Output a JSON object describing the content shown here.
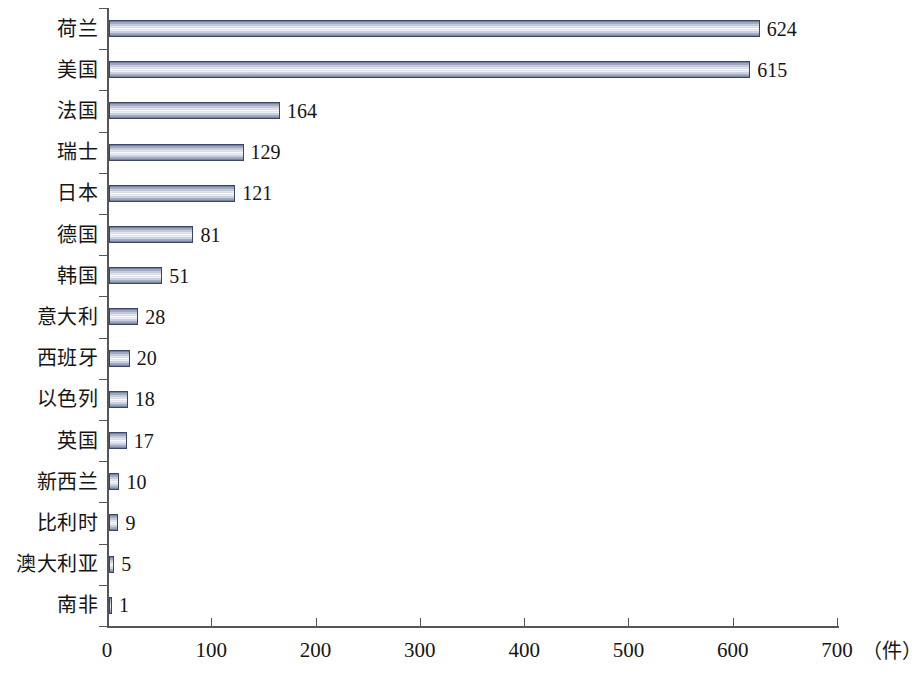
{
  "chart_data": {
    "type": "bar",
    "orientation": "horizontal",
    "title": "",
    "subtitle": "",
    "xlabel": "（件）",
    "ylabel": "",
    "xlim": [
      0,
      700
    ],
    "xticks": [
      0,
      100,
      200,
      300,
      400,
      500,
      600,
      700
    ],
    "xtick_labels": [
      "0",
      "100",
      "200",
      "300",
      "400",
      "500",
      "600",
      "700"
    ],
    "grid": false,
    "legend": null,
    "categories": [
      "荷兰",
      "美国",
      "法国",
      "瑞士",
      "日本",
      "德国",
      "韩国",
      "意大利",
      "西班牙",
      "以色列",
      "英国",
      "新西兰",
      "比利时",
      "澳大利亚",
      "南非"
    ],
    "values": [
      624,
      615,
      164,
      129,
      121,
      81,
      51,
      28,
      20,
      18,
      17,
      10,
      9,
      5,
      1
    ],
    "value_labels": [
      "624",
      "615",
      "164",
      "129",
      "121",
      "81",
      "51",
      "28",
      "20",
      "18",
      "17",
      "10",
      "9",
      "5",
      "1"
    ],
    "bar_color_edge": "#3c4663",
    "bar_color_fill_dark": "#6e7a9c",
    "bar_color_fill_light": "#ffffff",
    "axis_color": "#55555c",
    "background_color": "#ffffff"
  }
}
